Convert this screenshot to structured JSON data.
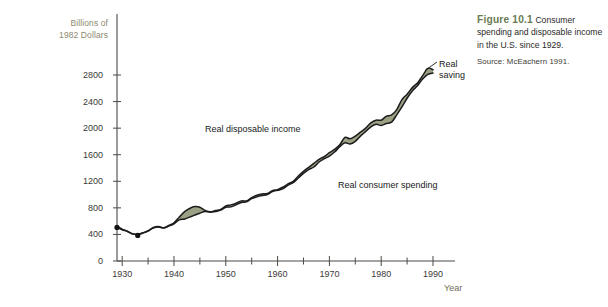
{
  "figure": {
    "number_label": "Figure 10.1",
    "caption_text": "Consumer spending and disposable income in the U.S. since 1929.",
    "source": "Source: McEachern 1991."
  },
  "axes": {
    "y_title_line1": "Billions of",
    "y_title_line2": "1982 Dollars",
    "x_title": "Year",
    "y_ticks": [
      "0",
      "400",
      "800",
      "1200",
      "1600",
      "2000",
      "2400",
      "2800"
    ],
    "x_ticks": [
      "1930",
      "1940",
      "1950",
      "1960",
      "1970",
      "1980",
      "1990"
    ]
  },
  "labels": {
    "disposable_income": "Real disposable income",
    "consumer_spending": "Real consumer spending",
    "saving_line1": "Real",
    "saving_line2": "saving"
  },
  "colors": {
    "band_fill": "#9aa083",
    "band_stroke": "#1c1c1c",
    "axis": "#4a4a46",
    "caption_accent": "#6b7a52",
    "y_title": "#8c8a6e"
  },
  "chart_data": {
    "type": "area",
    "title": "Consumer spending and disposable income in the U.S. since 1929",
    "xlabel": "Year",
    "ylabel": "Billions of 1982 Dollars",
    "xlim": [
      1929,
      1990
    ],
    "ylim": [
      0,
      3000
    ],
    "grid": false,
    "legend": "inline-annotations",
    "annotations": [
      {
        "text": "Real disposable income",
        "x": 1958,
        "y": 1780
      },
      {
        "text": "Real consumer spending",
        "x": 1971,
        "y": 1080
      },
      {
        "text": "Real saving",
        "x": 1992,
        "y": 2830,
        "leader_to": [
          1989,
          2760
        ]
      }
    ],
    "series": [
      {
        "name": "Real disposable income",
        "x": [
          1929,
          1930,
          1931,
          1932,
          1933,
          1934,
          1935,
          1936,
          1937,
          1938,
          1939,
          1940,
          1941,
          1942,
          1943,
          1944,
          1945,
          1946,
          1947,
          1948,
          1949,
          1950,
          1951,
          1952,
          1953,
          1954,
          1955,
          1956,
          1957,
          1958,
          1959,
          1960,
          1961,
          1962,
          1963,
          1964,
          1965,
          1966,
          1967,
          1968,
          1969,
          1970,
          1971,
          1972,
          1973,
          1974,
          1975,
          1976,
          1977,
          1978,
          1979,
          1980,
          1981,
          1982,
          1983,
          1984,
          1985,
          1986,
          1987,
          1988,
          1989,
          1990
        ],
        "values": [
          520,
          480,
          450,
          410,
          400,
          425,
          455,
          505,
          520,
          500,
          535,
          575,
          660,
          740,
          790,
          820,
          810,
          760,
          740,
          760,
          775,
          830,
          845,
          870,
          905,
          905,
          955,
          990,
          1010,
          1015,
          1060,
          1075,
          1110,
          1160,
          1200,
          1280,
          1350,
          1410,
          1470,
          1530,
          1570,
          1630,
          1680,
          1750,
          1860,
          1840,
          1880,
          1940,
          2000,
          2080,
          2120,
          2120,
          2180,
          2200,
          2280,
          2430,
          2510,
          2610,
          2680,
          2790,
          2900,
          2880
        ]
      },
      {
        "name": "Real consumer spending",
        "x": [
          1929,
          1930,
          1931,
          1932,
          1933,
          1934,
          1935,
          1936,
          1937,
          1938,
          1939,
          1940,
          1941,
          1942,
          1943,
          1944,
          1945,
          1946,
          1947,
          1948,
          1949,
          1950,
          1951,
          1952,
          1953,
          1954,
          1955,
          1956,
          1957,
          1958,
          1959,
          1960,
          1961,
          1962,
          1963,
          1964,
          1965,
          1966,
          1967,
          1968,
          1969,
          1970,
          1971,
          1972,
          1973,
          1974,
          1975,
          1976,
          1977,
          1978,
          1979,
          1980,
          1981,
          1982,
          1983,
          1984,
          1985,
          1986,
          1987,
          1988,
          1989,
          1990
        ],
        "values": [
          510,
          470,
          445,
          408,
          398,
          420,
          450,
          495,
          512,
          496,
          525,
          560,
          620,
          630,
          660,
          690,
          720,
          745,
          735,
          745,
          765,
          810,
          815,
          845,
          880,
          890,
          940,
          965,
          985,
          1000,
          1045,
          1065,
          1085,
          1140,
          1180,
          1250,
          1320,
          1375,
          1415,
          1490,
          1540,
          1580,
          1640,
          1720,
          1780,
          1760,
          1800,
          1880,
          1950,
          2020,
          2060,
          2040,
          2070,
          2090,
          2200,
          2320,
          2450,
          2560,
          2640,
          2740,
          2810,
          2830
        ]
      }
    ]
  }
}
